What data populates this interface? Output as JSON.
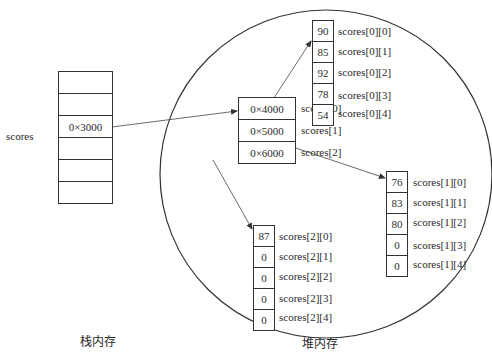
{
  "stack": {
    "label": "栈内存",
    "variable_name": "scores",
    "cells": [
      "",
      "",
      "0×3000",
      "",
      "",
      ""
    ]
  },
  "heap": {
    "label": "堆内存",
    "pointer_array": {
      "cells": [
        {
          "value": "0×4000",
          "label": "scores[0]"
        },
        {
          "value": "0×5000",
          "label": "scores[1]"
        },
        {
          "value": "0×6000",
          "label": "scores[2]"
        }
      ]
    },
    "rows": [
      {
        "name": "scores[0]",
        "cells": [
          {
            "value": "90",
            "label": "scores[0][0]"
          },
          {
            "value": "85",
            "label": "scores[0][1]"
          },
          {
            "value": "92",
            "label": "scores[0][2]"
          },
          {
            "value": "78",
            "label": "scores[0][3]"
          },
          {
            "value": "54",
            "label": "scores[0][4]"
          }
        ]
      },
      {
        "name": "scores[1]",
        "cells": [
          {
            "value": "76",
            "label": "scores[1][0]"
          },
          {
            "value": "83",
            "label": "scores[1][1]"
          },
          {
            "value": "80",
            "label": "scores[1][2]"
          },
          {
            "value": "0",
            "label": "scores[1][3]"
          },
          {
            "value": "0",
            "label": "scores[1][4]"
          }
        ]
      },
      {
        "name": "scores[2]",
        "cells": [
          {
            "value": "87",
            "label": "scores[2][0]"
          },
          {
            "value": "0",
            "label": "scores[2][1]"
          },
          {
            "value": "0",
            "label": "scores[2][2]"
          },
          {
            "value": "0",
            "label": "scores[2][3]"
          },
          {
            "value": "0",
            "label": "scores[2][4]"
          }
        ]
      }
    ]
  },
  "colors": {
    "line": "#333333",
    "text": "#2a2a2a",
    "background": "#ffffff"
  }
}
